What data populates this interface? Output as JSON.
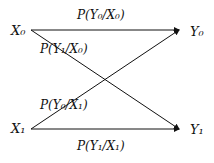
{
  "diagram": {
    "nodes": {
      "x0": "X₀",
      "x1": "X₁",
      "y0": "Y₀",
      "y1": "Y₁"
    },
    "edges": {
      "x0_y0": "P(Y₀/X₀)",
      "x0_y1": "P(Y₁/X₀)",
      "x1_y0": "P(Y₀/X₁)",
      "x1_y1": "P(Y₁/X₁)"
    }
  }
}
